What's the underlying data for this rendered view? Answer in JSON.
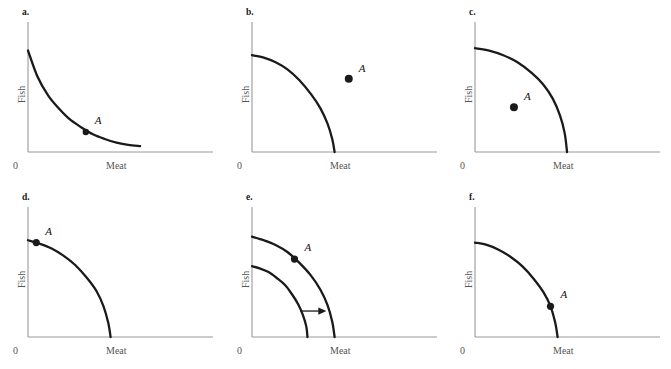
{
  "figure": {
    "title": "",
    "axis_x_label": "Meat",
    "axis_y_label": "Fish",
    "origin_label": "0",
    "point_label": "A",
    "curve_color": "#1a1a1a",
    "axis_color": "#999999",
    "text_color": "#555555",
    "background": "#ffffff"
  },
  "chart_data": {
    "type": "line",
    "xlabel": "Meat",
    "ylabel": "Fish",
    "xlim": [
      0,
      100
    ],
    "ylim": [
      0,
      100
    ],
    "grid": false,
    "legend": "none",
    "panels": [
      {
        "id": "a",
        "label": "a.",
        "curve_shape": "convex",
        "description": "Convex (bowed toward origin) frontier; point A lies on the curve at mid-right.",
        "curves": [
          {
            "name": "frontier",
            "x": [
              0,
              8,
              17,
              26,
              35,
              45,
              55,
              65,
              75,
              85,
              95
            ],
            "y": [
              86,
              64,
              48,
              37,
              28,
              21,
              15,
              11,
              8,
              6,
              5
            ]
          }
        ],
        "points": [
          {
            "name": "A",
            "label": "A",
            "x": 49,
            "y": 17,
            "on_curve": true,
            "label_dx": 9,
            "label_dy": -12,
            "radius": 3.2
          }
        ],
        "arrow": null
      },
      {
        "id": "b",
        "label": "b.",
        "curve_shape": "concave",
        "description": "Concave frontier; point A lies outside the curve (unattainable).",
        "curves": [
          {
            "name": "frontier",
            "x": [
              0,
              10,
              20,
              30,
              40,
              50,
              58,
              64,
              68,
              70
            ],
            "y": [
              82,
              80,
              76,
              70,
              61,
              49,
              37,
              24,
              11,
              0
            ]
          }
        ],
        "points": [
          {
            "name": "A",
            "label": "A",
            "x": 82,
            "y": 62,
            "on_curve": false,
            "label_dx": 10,
            "label_dy": -11,
            "radius": 4.0
          }
        ],
        "arrow": null
      },
      {
        "id": "c",
        "label": "c.",
        "curve_shape": "concave",
        "description": "Strongly concave frontier; point A lies inside the curve (inefficient).",
        "curves": [
          {
            "name": "frontier",
            "x": [
              0,
              12,
              24,
              36,
              48,
              58,
              66,
              72,
              76,
              78
            ],
            "y": [
              88,
              86,
              82,
              76,
              67,
              57,
              45,
              31,
              16,
              0
            ]
          }
        ],
        "points": [
          {
            "name": "A",
            "label": "A",
            "x": 33,
            "y": 38,
            "on_curve": false,
            "label_dx": 10,
            "label_dy": -11,
            "radius": 4.0
          }
        ],
        "arrow": null
      },
      {
        "id": "d",
        "label": "d.",
        "curve_shape": "concave",
        "description": "Concave frontier; point A lies on the curve near the vertical (Fish) intercept.",
        "curves": [
          {
            "name": "frontier",
            "x": [
              0,
              10,
              20,
              30,
              40,
              50,
              58,
              64,
              68,
              70
            ],
            "y": [
              82,
              79,
              75,
              69,
              61,
              50,
              39,
              26,
              12,
              0
            ]
          }
        ],
        "points": [
          {
            "name": "A",
            "label": "A",
            "x": 7,
            "y": 80,
            "on_curve": true,
            "label_dx": 9,
            "label_dy": -12,
            "radius": 3.6
          }
        ],
        "arrow": null
      },
      {
        "id": "e",
        "label": "e.",
        "curve_shape": "concave",
        "description": "Two concave frontiers: an inner original curve and an outer shifted curve, with a right-pointing arrow indicating outward expansion. Point A lies on the outer curve.",
        "curves": [
          {
            "name": "frontier-outer",
            "x": [
              0,
              10,
              20,
              30,
              40,
              50,
              58,
              64,
              68,
              70
            ],
            "y": [
              85,
              82,
              78,
              72,
              63,
              52,
              40,
              27,
              13,
              0
            ]
          },
          {
            "name": "frontier-inner",
            "x": [
              0,
              7,
              14,
              21,
              28,
              34,
              39,
              43,
              46,
              47
            ],
            "y": [
              60,
              58,
              55,
              50,
              44,
              36,
              28,
              19,
              9,
              0
            ]
          }
        ],
        "points": [
          {
            "name": "A",
            "label": "A",
            "x": 36,
            "y": 66,
            "on_curve": true,
            "label_dx": 10,
            "label_dy": -12,
            "radius": 3.6
          }
        ],
        "arrow": {
          "name": "shift-arrow",
          "x1": 41,
          "y1": 22,
          "x2": 63,
          "y2": 22,
          "direction": "right",
          "meaning": "outward shift of the frontier"
        }
      },
      {
        "id": "f",
        "label": "f.",
        "curve_shape": "concave",
        "description": "Concave frontier; point A lies on the curve low down, near the horizontal (Meat) intercept.",
        "curves": [
          {
            "name": "frontier",
            "x": [
              0,
              10,
              20,
              30,
              40,
              50,
              58,
              64,
              68,
              70
            ],
            "y": [
              80,
              78,
              74,
              68,
              60,
              49,
              38,
              26,
              12,
              0
            ]
          }
        ],
        "points": [
          {
            "name": "A",
            "label": "A",
            "x": 64,
            "y": 26,
            "on_curve": true,
            "label_dx": 10,
            "label_dy": -12,
            "radius": 3.6
          }
        ],
        "arrow": null
      }
    ]
  }
}
